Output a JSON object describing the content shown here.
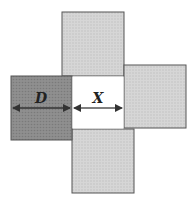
{
  "diagram": {
    "labels": {
      "d": "D",
      "x": "X"
    },
    "colors": {
      "light_square": "#d4d4d4",
      "dark_square": "#8a8a8a",
      "center": "#ffffff",
      "stroke": "#555555",
      "arrow": "#333333"
    },
    "squares": [
      {
        "id": "top",
        "x": 62,
        "y": 12,
        "w": 62,
        "h": 64
      },
      {
        "id": "right",
        "x": 124,
        "y": 65,
        "w": 62,
        "h": 63
      },
      {
        "id": "bottom",
        "x": 72,
        "y": 129,
        "w": 62,
        "h": 64
      },
      {
        "id": "left",
        "x": 11,
        "y": 76,
        "w": 61,
        "h": 64
      }
    ],
    "center_gap": {
      "x": 72,
      "y": 76,
      "w": 52,
      "h": 53
    }
  }
}
